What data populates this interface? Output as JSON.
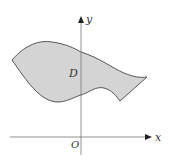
{
  "diagram": {
    "region_label": "D",
    "x_axis_label": "x",
    "y_axis_label": "y",
    "origin_label": "O",
    "region_fill": "#d3d3d3",
    "stroke_color": "#555555"
  }
}
